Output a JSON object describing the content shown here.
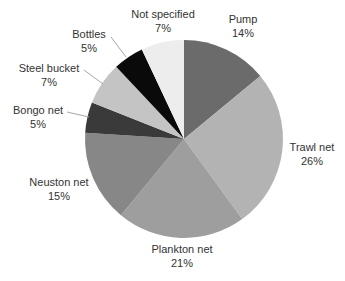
{
  "chart_data": {
    "type": "pie",
    "title": "",
    "start_angle_deg": 0,
    "direction": "clockwise",
    "slices": [
      {
        "label": "Pump",
        "value": 14,
        "display": "14%",
        "color": "#6b6b6b"
      },
      {
        "label": "Trawl net",
        "value": 26,
        "display": "26%",
        "color": "#b3b3b3"
      },
      {
        "label": "Plankton net",
        "value": 21,
        "display": "21%",
        "color": "#9e9e9e"
      },
      {
        "label": "Neuston net",
        "value": 15,
        "display": "15%",
        "color": "#878787"
      },
      {
        "label": "Bongo net",
        "value": 5,
        "display": "5%",
        "color": "#3a3a3a"
      },
      {
        "label": "Steel bucket",
        "value": 7,
        "display": "7%",
        "color": "#c4c4c4"
      },
      {
        "label": "Bottles",
        "value": 5,
        "display": "5%",
        "color": "#0a0a0a"
      },
      {
        "label": "Not specified",
        "value": 7,
        "display": "7%",
        "color": "#ededed"
      }
    ],
    "legend": "none (direct labels)",
    "unit": "%"
  },
  "labels": [
    {
      "name": "Pump",
      "pct": "14%",
      "x": 243,
      "y": 23,
      "anchor": "middle"
    },
    {
      "name": "Trawl net",
      "pct": "26%",
      "x": 312,
      "y": 151,
      "anchor": "middle"
    },
    {
      "name": "Plankton net",
      "pct": "21%",
      "x": 182,
      "y": 253,
      "anchor": "middle"
    },
    {
      "name": "Neuston net",
      "pct": "15%",
      "x": 59,
      "y": 186,
      "anchor": "middle"
    },
    {
      "name": "Bongo net",
      "pct": "5%",
      "x": 38,
      "y": 114,
      "anchor": "middle"
    },
    {
      "name": "Steel bucket",
      "pct": "7%",
      "x": 49,
      "y": 72,
      "anchor": "middle"
    },
    {
      "name": "Bottles",
      "pct": "5%",
      "x": 89,
      "y": 38,
      "anchor": "middle"
    },
    {
      "name": "Not specified",
      "pct": "7%",
      "x": 163,
      "y": 18,
      "anchor": "middle"
    }
  ],
  "leaders": [
    {
      "for": "Bongo net",
      "x1": 67,
      "y1": 112,
      "x2": 89,
      "y2": 117
    },
    {
      "for": "Steel bucket",
      "x1": 84,
      "y1": 70,
      "x2": 103,
      "y2": 84
    },
    {
      "for": "Bottles",
      "x1": 111,
      "y1": 37,
      "x2": 126,
      "y2": 57
    }
  ],
  "geometry": {
    "cx": 184,
    "cy": 139,
    "r": 99
  }
}
